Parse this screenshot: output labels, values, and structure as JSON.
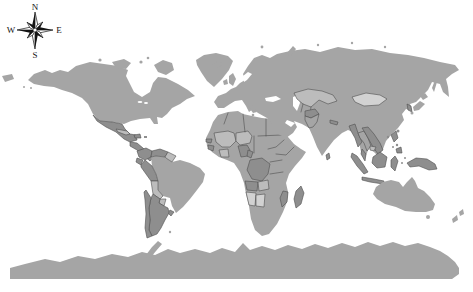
{
  "compass": {
    "north": "N",
    "east": "E",
    "south": "S",
    "west": "W"
  },
  "map": {
    "colors": {
      "ocean": "#ffffff",
      "land_base": "#a5a5a5",
      "land_dark": "#8e8e8e",
      "land_light": "#bcbcbc",
      "land_lighter": "#d2d2d2",
      "border": "#4f4f4f",
      "inland_water": "#ffffff",
      "compass_ink": "#141414",
      "compass_face": "#ffffff"
    },
    "shading_categories": {
      "base_gray": [
        "United States",
        "Canada",
        "Greenland",
        "Europe",
        "Russia",
        "China",
        "India",
        "Middle East",
        "Brazil",
        "Australia",
        "Japan",
        "North Africa",
        "Antarctica"
      ],
      "dark_gray": [
        "Mexico",
        "Central America",
        "Hispaniola",
        "Colombia",
        "Venezuela",
        "Ecuador",
        "Peru",
        "Chile",
        "Argentina",
        "Nigeria",
        "DR Congo",
        "Angola",
        "Madagascar",
        "Afghanistan",
        "Myanmar",
        "Vietnam",
        "Malaysia",
        "Indonesia",
        "Philippines",
        "New Guinea",
        "Korea"
      ],
      "light_gray": [
        "Cuba",
        "Guyanas",
        "Bolivia",
        "Paraguay",
        "Mali",
        "Niger",
        "Ghana",
        "Zambia",
        "Kazakhstan"
      ],
      "lighter_gray": [
        "Mongolia",
        "Namibia",
        "Botswana"
      ]
    }
  }
}
